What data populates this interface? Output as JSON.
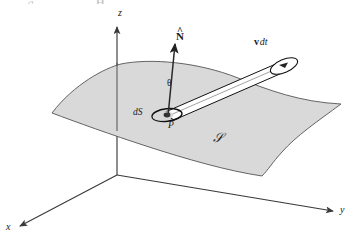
{
  "figure": {
    "domain": "vector-calculus-flux-diagram",
    "caption_fragments": {
      "left": "g",
      "right": "H"
    },
    "colors": {
      "surface_fill": "#d9d9d9",
      "surface_stroke": "#555555",
      "axis_stroke": "#3a3a3a",
      "tube_stroke": "#111111",
      "tube_fill": "#ffffff",
      "label_color": "#1a1a1a",
      "background": "#ffffff"
    },
    "axes": [
      {
        "name": "z-axis",
        "label": "z",
        "direction": "up"
      },
      {
        "name": "y-axis",
        "label": "y",
        "direction": "right"
      },
      {
        "name": "x-axis",
        "label": "x",
        "direction": "lower-left"
      }
    ],
    "labels": {
      "normal_vector": {
        "base": "N",
        "accent": "^",
        "display": "N̂"
      },
      "angle": "θ",
      "velocity_displacement": {
        "vector": "v",
        "scalar": "dt"
      },
      "area_element": "dS",
      "point": "P",
      "surface": "𝒮"
    },
    "elements": [
      {
        "name": "surface",
        "label": "𝒮",
        "description": "shaded curved surface patch"
      },
      {
        "name": "normal-vector",
        "label": "N̂",
        "description": "unit normal arrow at point P"
      },
      {
        "name": "angle-theta",
        "label": "θ",
        "description": "angle between normal and velocity tube"
      },
      {
        "name": "flux-tube",
        "label": "v dt",
        "description": "oblique cylinder of fluid swept in time dt"
      },
      {
        "name": "area-element",
        "label": "dS",
        "description": "small ellipse patch at P"
      },
      {
        "name": "point-p",
        "label": "P",
        "description": "point on the surface"
      }
    ]
  }
}
